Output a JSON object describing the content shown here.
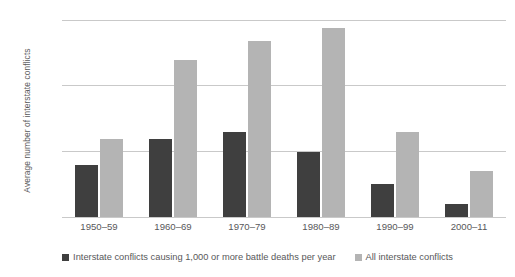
{
  "chart_data": {
    "type": "bar",
    "title": "",
    "subtitle": "",
    "xlabel": "",
    "ylabel": "Average number of interstate conflicts",
    "categories": [
      "1950–59",
      "1960–69",
      "1970–79",
      "1980–89",
      "1990–99",
      "2000–11"
    ],
    "series": [
      {
        "name": "Interstate conflicts causing 1,000 or more battle deaths per year",
        "color": "#3f3f3f",
        "values": [
          0.8,
          1.2,
          1.3,
          1.0,
          0.5,
          0.2
        ]
      },
      {
        "name": "All interstate conflicts",
        "color": "#b4b4b4",
        "values": [
          1.2,
          2.4,
          2.7,
          2.9,
          1.3,
          0.7
        ]
      }
    ],
    "ylim": [
      0,
      3
    ],
    "yticks": [
      0,
      1,
      2,
      3
    ],
    "ytick_labels": [
      "0",
      "1",
      "2",
      "3"
    ],
    "grid": true,
    "grid_color": "#c9c9c9",
    "legend_position": "bottom"
  },
  "legend": {
    "entries": [
      {
        "label": "Interstate conflicts causing 1,000 or more battle deaths per year",
        "swatch": "dark-gray-square"
      },
      {
        "label": "All interstate conflicts",
        "swatch": "light-gray-square"
      }
    ]
  }
}
